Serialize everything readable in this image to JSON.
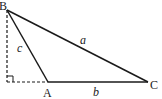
{
  "diagram": {
    "type": "triangle",
    "vertices": {
      "B": {
        "label": "B",
        "x": 7,
        "y": 10
      },
      "A": {
        "label": "A",
        "x": 48,
        "y": 82
      },
      "C": {
        "label": "C",
        "x": 148,
        "y": 82
      },
      "foot": {
        "x": 7,
        "y": 82
      }
    },
    "sides": {
      "a": {
        "label": "a",
        "from": "B",
        "to": "C"
      },
      "b": {
        "label": "b",
        "from": "A",
        "to": "C"
      },
      "c": {
        "label": "c",
        "from": "B",
        "to": "A"
      }
    },
    "construction": {
      "altitude": "dashed line from B perpendicular to extension of CA",
      "extension": "dashed extension of CA to foot",
      "right_angle_marker": true
    },
    "colors": {
      "stroke": "#1a1a1a",
      "background": "#ffffff"
    }
  }
}
